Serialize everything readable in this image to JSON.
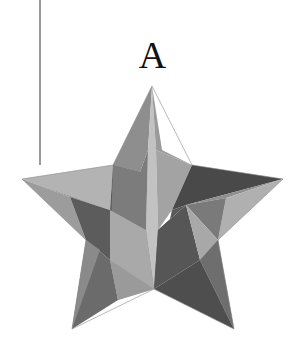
{
  "figure": {
    "label": "A",
    "shape": "faceted-five-point-star",
    "colors": {
      "light": "#b5b5b5",
      "lighter": "#c4c4c4",
      "mid": "#959595",
      "midlight": "#a6a6a6",
      "dark": "#6a6a6a",
      "darker": "#545454",
      "darkest": "#474747",
      "line": "#9a9a9a"
    }
  }
}
